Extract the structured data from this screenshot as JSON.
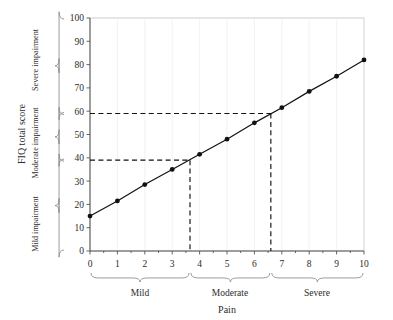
{
  "chart_data": {
    "type": "line",
    "title": "",
    "xlabel": "Pain",
    "ylabel": "FIQ total score",
    "x": [
      0,
      1,
      2,
      3,
      4,
      5,
      6,
      7,
      8,
      9,
      10
    ],
    "values": [
      15,
      21.5,
      28.5,
      35,
      41.5,
      48,
      55,
      61.5,
      68.5,
      75,
      82
    ],
    "series": [
      {
        "name": "FIQ total score",
        "values": [
          15,
          21.5,
          28.5,
          35,
          41.5,
          48,
          55,
          61.5,
          68.5,
          75,
          82
        ]
      }
    ],
    "xlim": [
      0,
      10
    ],
    "ylim": [
      0,
      100
    ],
    "xticks": [
      "0",
      "1",
      "2",
      "3",
      "4",
      "5",
      "6",
      "7",
      "8",
      "9",
      "10"
    ],
    "yticks": [
      "0",
      "10",
      "20",
      "30",
      "40",
      "50",
      "60",
      "70",
      "80",
      "90",
      "100"
    ],
    "grid": true,
    "legend": "none",
    "marker": "filled-circle",
    "annotations": [
      {
        "name": "mild-moderate-threshold",
        "type": "reference-lines",
        "y": 39,
        "x": 3.65,
        "style": "dashed"
      },
      {
        "name": "moderate-severe-threshold",
        "type": "reference-lines",
        "y": 59,
        "x": 6.6,
        "style": "dashed"
      }
    ],
    "x_bands": [
      {
        "label": "Mild",
        "from": 0,
        "to": 3.65
      },
      {
        "label": "Moderate",
        "from": 3.65,
        "to": 6.6
      },
      {
        "label": "Severe",
        "from": 6.6,
        "to": 10
      }
    ],
    "y_bands": [
      {
        "label": "Mild impairment",
        "from": 0,
        "to": 39
      },
      {
        "label": "Moderate impairment",
        "from": 39,
        "to": 59
      },
      {
        "label": "Severe impairment",
        "from": 59,
        "to": 100
      }
    ]
  },
  "axes": {
    "y_outer_title": "FIQ total score",
    "x_title": "Pain"
  }
}
